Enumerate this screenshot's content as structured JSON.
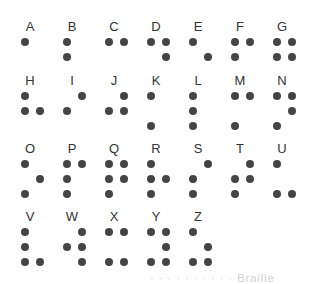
{
  "dot_color": "#444444",
  "label_color": "#333333",
  "letters": [
    {
      "char": "A",
      "dots": [
        1
      ]
    },
    {
      "char": "B",
      "dots": [
        1,
        2
      ]
    },
    {
      "char": "C",
      "dots": [
        1,
        4
      ]
    },
    {
      "char": "D",
      "dots": [
        1,
        4,
        5
      ]
    },
    {
      "char": "E",
      "dots": [
        1,
        5
      ]
    },
    {
      "char": "F",
      "dots": [
        1,
        2,
        4
      ]
    },
    {
      "char": "G",
      "dots": [
        1,
        2,
        4,
        5
      ]
    },
    {
      "char": "H",
      "dots": [
        1,
        2,
        5
      ]
    },
    {
      "char": "I",
      "dots": [
        2,
        4
      ]
    },
    {
      "char": "J",
      "dots": [
        2,
        4,
        5
      ]
    },
    {
      "char": "K",
      "dots": [
        1,
        3
      ]
    },
    {
      "char": "L",
      "dots": [
        1,
        2,
        3
      ]
    },
    {
      "char": "M",
      "dots": [
        1,
        3,
        4
      ]
    },
    {
      "char": "N",
      "dots": [
        1,
        3,
        4,
        5
      ]
    },
    {
      "char": "O",
      "dots": [
        1,
        3,
        5
      ]
    },
    {
      "char": "P",
      "dots": [
        1,
        2,
        3,
        4
      ]
    },
    {
      "char": "Q",
      "dots": [
        1,
        2,
        3,
        4,
        5
      ]
    },
    {
      "char": "R",
      "dots": [
        1,
        2,
        3,
        5
      ]
    },
    {
      "char": "S",
      "dots": [
        2,
        3,
        4
      ]
    },
    {
      "char": "T",
      "dots": [
        2,
        3,
        4,
        5
      ]
    },
    {
      "char": "U",
      "dots": [
        1,
        3,
        6
      ]
    },
    {
      "char": "V",
      "dots": [
        1,
        2,
        3,
        6
      ]
    },
    {
      "char": "W",
      "dots": [
        2,
        4,
        5,
        6
      ]
    },
    {
      "char": "X",
      "dots": [
        1,
        3,
        4,
        6
      ]
    },
    {
      "char": "Y",
      "dots": [
        1,
        3,
        4,
        5,
        6
      ]
    },
    {
      "char": "Z",
      "dots": [
        1,
        3,
        5,
        6
      ]
    }
  ],
  "layout": {
    "per_row": 7,
    "col_x": [
      18,
      60,
      102,
      144,
      186,
      228,
      270
    ],
    "row_y": [
      20,
      74,
      142,
      210
    ]
  },
  "caption": "· · ·   ·   · · ·   · · ·   Braille"
}
